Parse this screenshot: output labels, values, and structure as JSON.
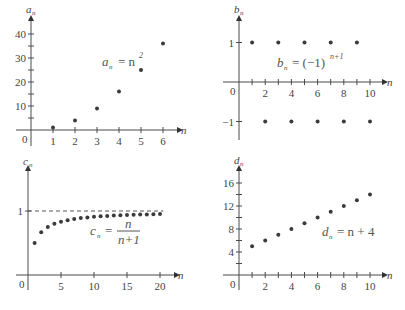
{
  "chart_data": [
    {
      "type": "scatter",
      "title": "",
      "formula": "a_n = n^2",
      "xlabel": "n",
      "ylabel": "a_n",
      "x": [
        1,
        2,
        3,
        4,
        5,
        6
      ],
      "values": [
        1,
        4,
        9,
        16,
        25,
        36
      ],
      "x_ticks": [
        "1",
        "2",
        "3",
        "4",
        "5",
        "6"
      ],
      "y_ticks": [
        "10",
        "20",
        "30",
        "40"
      ],
      "origin_label": "0",
      "xlim": [
        0,
        6.5
      ],
      "ylim": [
        0,
        43
      ],
      "grid": false
    },
    {
      "type": "scatter",
      "title": "",
      "formula": "b_n = (-1)^(n+1)",
      "xlabel": "n",
      "ylabel": "b_n",
      "x": [
        1,
        2,
        3,
        4,
        5,
        6,
        7,
        8,
        9,
        10
      ],
      "values": [
        1,
        -1,
        1,
        -1,
        1,
        -1,
        1,
        -1,
        1,
        -1
      ],
      "x_ticks": [
        "2",
        "4",
        "6",
        "8",
        "10"
      ],
      "y_ticks": [
        "1",
        "-1"
      ],
      "origin_label": "0",
      "xlim": [
        0,
        10.8
      ],
      "ylim": [
        -1.5,
        1.6
      ],
      "grid": false
    },
    {
      "type": "scatter",
      "title": "",
      "formula": "c_n = n/(n+1)",
      "xlabel": "n",
      "ylabel": "c_n",
      "x": [
        1,
        2,
        3,
        4,
        5,
        6,
        7,
        8,
        9,
        10,
        11,
        12,
        13,
        14,
        15,
        16,
        17,
        18,
        19,
        20
      ],
      "values": [
        0.5,
        0.667,
        0.75,
        0.8,
        0.833,
        0.857,
        0.875,
        0.889,
        0.9,
        0.909,
        0.917,
        0.923,
        0.929,
        0.933,
        0.938,
        0.941,
        0.944,
        0.947,
        0.95,
        0.952
      ],
      "x_ticks": [
        "5",
        "10",
        "15",
        "20"
      ],
      "y_ticks": [
        "1"
      ],
      "asymptote": 1,
      "origin_label": "0",
      "xlim": [
        0,
        21.5
      ],
      "ylim": [
        0,
        1.35
      ],
      "grid": false
    },
    {
      "type": "scatter",
      "title": "",
      "formula": "d_n = n + 4",
      "xlabel": "n",
      "ylabel": "d_n",
      "x": [
        1,
        2,
        3,
        4,
        5,
        6,
        7,
        8,
        9,
        10
      ],
      "values": [
        5,
        6,
        7,
        8,
        9,
        10,
        11,
        12,
        13,
        14
      ],
      "x_ticks": [
        "2",
        "4",
        "6",
        "8",
        "10"
      ],
      "y_ticks": [
        "4",
        "8",
        "12",
        "16"
      ],
      "origin_label": "0",
      "xlim": [
        0,
        10.8
      ],
      "ylim": [
        0,
        17.5
      ],
      "grid": false
    }
  ],
  "labels": {
    "a": {
      "y": "a",
      "sub": "n",
      "x": "n",
      "formula_lhs": "a",
      "formula_sub": "n",
      "formula_rhs": "= n",
      "formula_sup": "2"
    },
    "b": {
      "y": "b",
      "sub": "n",
      "x": "n",
      "formula_lhs": "b",
      "formula_sub": "n",
      "formula_rhs": "= (−1)",
      "formula_sup": "n+1"
    },
    "c": {
      "y": "c",
      "sub": "n",
      "x": "n",
      "formula_lhs": "c",
      "formula_sub": "n",
      "formula_eq": "=",
      "formula_num": "n",
      "formula_den": "n+1"
    },
    "d": {
      "y": "d",
      "sub": "n",
      "x": "n",
      "formula_lhs": "d",
      "formula_sub": "n",
      "formula_rhs": "= n + 4"
    }
  }
}
